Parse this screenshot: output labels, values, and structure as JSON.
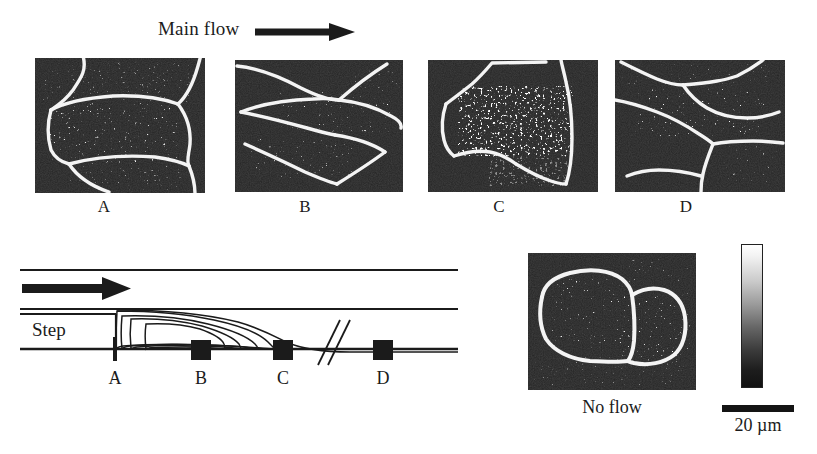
{
  "figure": {
    "background_color": "#ffffff",
    "ink_color": "#1b1b1b",
    "micrograph_background": "#0b0b0b",
    "micrograph_outline_color": "#ffffff"
  },
  "header": {
    "main_flow_label": "Main flow",
    "arrow_icon": "right-arrow-icon"
  },
  "micrograph_panels": [
    {
      "id": "A",
      "label": "A",
      "x": 35,
      "y": 58,
      "width": 170,
      "height": 135,
      "label_x": 104,
      "label_y": 198
    },
    {
      "id": "B",
      "label": "B",
      "x": 235,
      "y": 60,
      "width": 168,
      "height": 132,
      "label_x": 305,
      "label_y": 198
    },
    {
      "id": "C",
      "label": "C",
      "x": 428,
      "y": 60,
      "width": 170,
      "height": 132,
      "label_x": 499,
      "label_y": 198
    },
    {
      "id": "D",
      "label": "D",
      "x": 615,
      "y": 60,
      "width": 170,
      "height": 132,
      "label_x": 686,
      "label_y": 198
    }
  ],
  "no_flow_panel": {
    "label": "No flow",
    "x": 528,
    "y": 253,
    "width": 168,
    "height": 137
  },
  "schematic": {
    "step_label": "Step",
    "flow_arrow_icon": "right-arrow-icon",
    "break_symbol_icon": "double-slash-break-icon",
    "station_markers": [
      {
        "label": "A",
        "type": "line",
        "x": 104
      },
      {
        "label": "B",
        "type": "square",
        "x": 190
      },
      {
        "label": "C",
        "type": "square",
        "x": 272
      },
      {
        "label": "D",
        "type": "square",
        "x": 372
      }
    ],
    "recirculation_streamline_count": 4
  },
  "legend": {
    "colorbar_icon": "grayscale-colorbar-icon",
    "colorbar_top_color": "#ffffff",
    "colorbar_bottom_color": "#121212",
    "scale_bar_label": "20 µm"
  }
}
